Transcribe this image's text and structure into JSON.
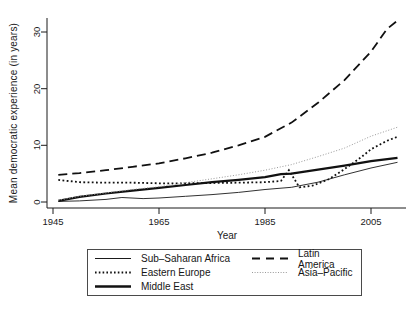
{
  "figure": {
    "background": "#ffffff",
    "axis_color": "#1a1a1a"
  },
  "chart_data": {
    "type": "line",
    "title": "",
    "xlabel": "Year",
    "ylabel": "Mean democratic experience (in years)",
    "xlim": [
      1944,
      2011.5
    ],
    "ylim": [
      0,
      33
    ],
    "xticks": [
      "1945",
      "1965",
      "1985",
      "2005"
    ],
    "yticks": [
      "0",
      "10",
      "20",
      "30"
    ],
    "grid": false,
    "legend_position": "bottom",
    "series": [
      {
        "id": "sub-saharan-africa",
        "name": "Sub–Saharan Africa",
        "style": {
          "color": "#1a1a1a",
          "width": 0.9,
          "dash": "",
          "legend_width": 1
        },
        "x": [
          1946,
          1950,
          1955,
          1958,
          1962,
          1965,
          1970,
          1975,
          1980,
          1985,
          1990,
          1995,
          2000,
          2005,
          2010
        ],
        "y": [
          0.1,
          0.2,
          0.45,
          0.8,
          0.6,
          0.7,
          1.0,
          1.3,
          1.7,
          2.2,
          2.6,
          3.5,
          4.8,
          6.0,
          7.0
        ]
      },
      {
        "id": "eastern-europe",
        "name": "Eastern Europe",
        "style": {
          "color": "#111111",
          "width": 1.8,
          "dash": "1.8 2.4",
          "legend_width": 2,
          "legend_dash": "1.6 2.2"
        },
        "x": [
          1946,
          1950,
          1955,
          1960,
          1965,
          1970,
          1975,
          1980,
          1985,
          1988,
          1989.5,
          1991.5,
          1994,
          1997,
          2000,
          2003,
          2005,
          2008,
          2010
        ],
        "y": [
          3.9,
          3.5,
          3.4,
          3.4,
          3.3,
          3.3,
          3.35,
          3.4,
          3.5,
          3.7,
          5.6,
          2.6,
          2.9,
          4.0,
          5.8,
          7.8,
          9.3,
          10.8,
          11.5
        ]
      },
      {
        "id": "middle-east",
        "name": "Middle East",
        "style": {
          "color": "#111111",
          "width": 2.2,
          "dash": "",
          "legend_width": 2.5
        },
        "x": [
          1946,
          1950,
          1955,
          1960,
          1965,
          1970,
          1975,
          1980,
          1985,
          1988,
          1990,
          1995,
          2000,
          2005,
          2010
        ],
        "y": [
          0.2,
          0.9,
          1.5,
          2.0,
          2.5,
          3.0,
          3.5,
          3.9,
          4.4,
          4.9,
          5.0,
          5.7,
          6.4,
          7.2,
          7.8
        ]
      },
      {
        "id": "latin-america",
        "name": "Latin America",
        "style": {
          "color": "#111111",
          "width": 1.8,
          "dash": "9 5",
          "legend_width": 2,
          "legend_dash": "8 6"
        },
        "x": [
          1946,
          1950,
          1955,
          1960,
          1965,
          1970,
          1975,
          1980,
          1985,
          1990,
          1995,
          2000,
          2005,
          2008,
          2010
        ],
        "y": [
          4.8,
          5.1,
          5.6,
          6.2,
          6.8,
          7.7,
          8.7,
          10.0,
          11.5,
          14.0,
          17.5,
          21.5,
          26.5,
          30.5,
          32.0
        ]
      },
      {
        "id": "asia-pacific",
        "name": "Asia–Pacific",
        "style": {
          "color": "#999999",
          "width": 1,
          "dash": "1 1.8",
          "legend_width": 1.2,
          "legend_dash": "1 1.6"
        },
        "x": [
          1946,
          1950,
          1955,
          1960,
          1965,
          1970,
          1975,
          1980,
          1985,
          1990,
          1995,
          2000,
          2005,
          2010
        ],
        "y": [
          0.3,
          1.0,
          1.6,
          2.2,
          2.7,
          3.4,
          4.1,
          4.8,
          5.6,
          6.6,
          8.0,
          9.5,
          11.6,
          13.2
        ]
      }
    ]
  }
}
